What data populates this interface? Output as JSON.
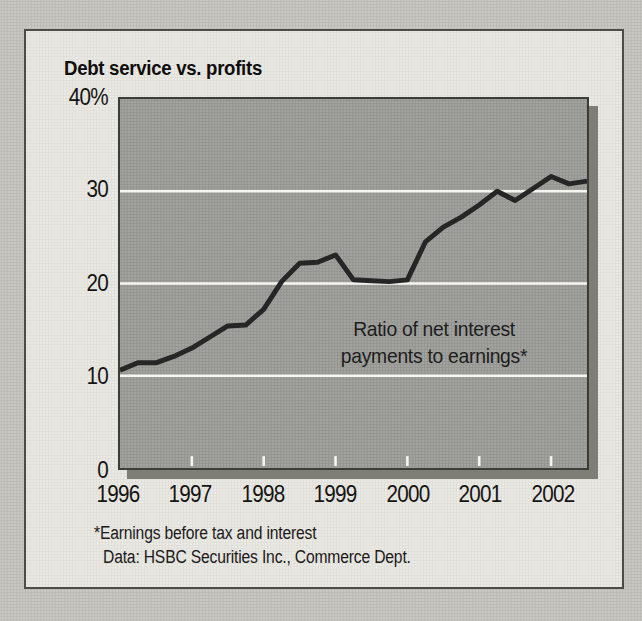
{
  "chart_data": {
    "type": "line",
    "title": "Debt service vs. profits",
    "annotation_lines": [
      "Ratio of net interest",
      "payments to earnings*"
    ],
    "footnote": "*Earnings before tax and interest",
    "source": "Data: HSBC Securities Inc., Commerce Dept.",
    "series": [
      {
        "name": "Ratio of net interest payments to earnings (%)",
        "frequency": "quarterly",
        "x_start_year": 1996.0,
        "x_step_years": 0.25,
        "values": [
          10.6,
          11.4,
          11.4,
          12.1,
          13.0,
          14.2,
          15.4,
          15.5,
          17.2,
          20.2,
          22.2,
          22.3,
          23.1,
          20.4,
          20.3,
          20.2,
          20.4,
          24.5,
          26.1,
          27.2,
          28.5,
          30.0,
          29.0,
          30.3,
          31.6,
          30.8,
          31.1
        ]
      }
    ],
    "xlim": [
      1996.0,
      2002.5
    ],
    "ylim": [
      0,
      40
    ],
    "y_gridlines": [
      10,
      20,
      30
    ],
    "y_axis_labels": [
      "40%",
      "30",
      "20",
      "10",
      "0"
    ],
    "x_tick_years": [
      "1996",
      "1997",
      "1998",
      "1999",
      "2000",
      "2001",
      "2002"
    ],
    "grid": "horizontal white gridlines only",
    "legend": "none; label annotated inside plot",
    "colors": {
      "page_bg": "#c9c8c2",
      "card_bg": "#ebe9e3",
      "card_border": "#4c4c48",
      "plot_bg": "#a2a29e",
      "plot_border": "#3c3c38",
      "plot_shadow": "#7e7e77",
      "gridline": "#f6f5f0",
      "tick": "#f6f5f0",
      "line": "#262626",
      "text": "#161616"
    }
  }
}
